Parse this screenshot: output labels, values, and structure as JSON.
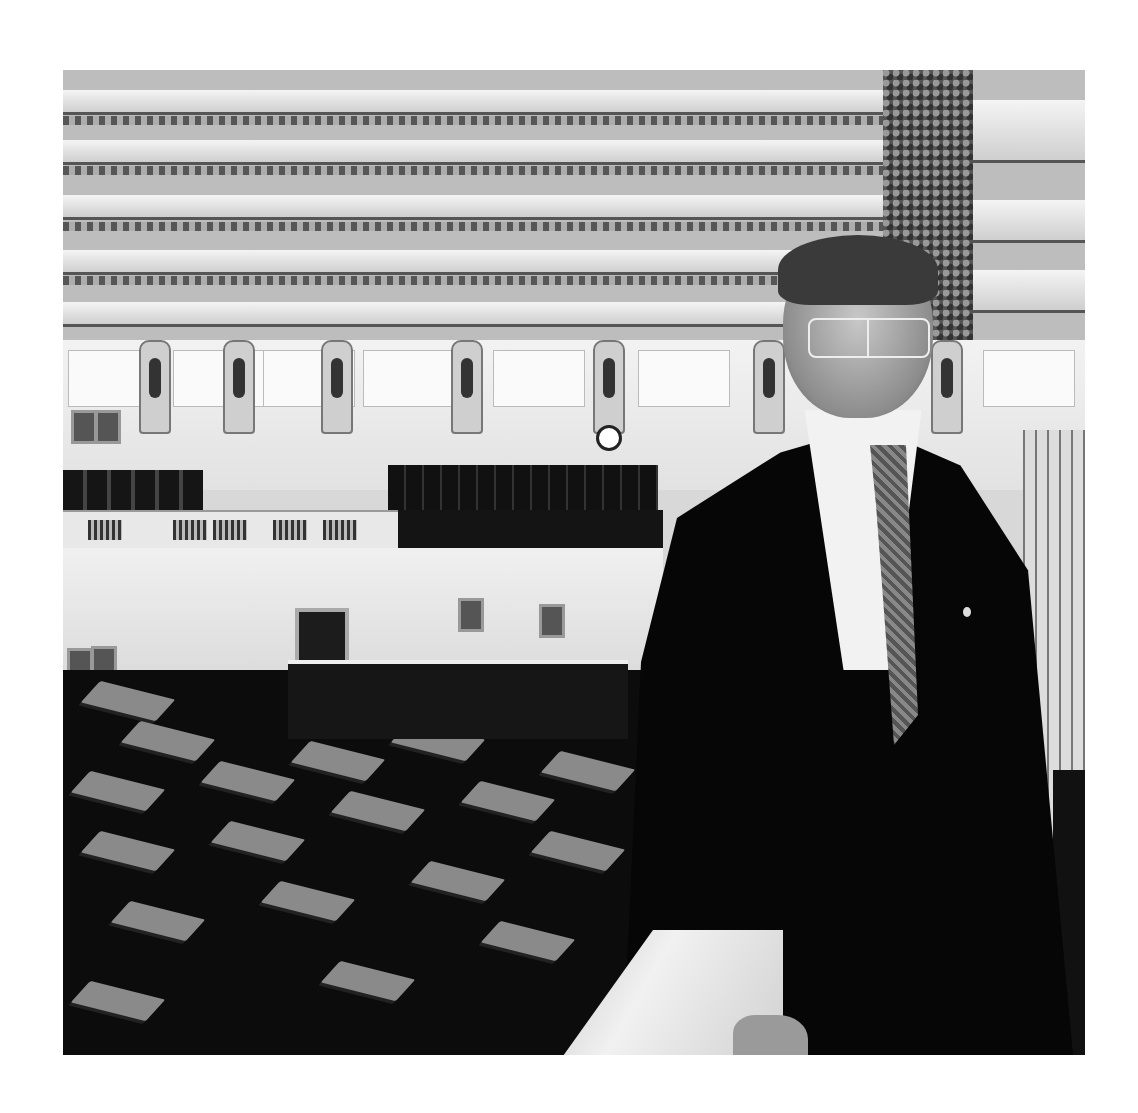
{
  "image": {
    "description": "Black and white photograph of a man in a dark suit, white shirt and patterned tie, wearing glasses, standing at a marble balcony rail in an ornate legislative chamber with coffered ceiling, upper gallery seating, and rows of desks on the floor below.",
    "style": "black-and-white",
    "subject": "man in suit at balcony rail",
    "setting": "legislative chamber",
    "colors": {
      "background": "#ffffff",
      "suit": "#060606",
      "shirt": "#f2f2f2",
      "wall": "#efefef",
      "floor": "#0c0c0c"
    },
    "elements": {
      "ceiling": "coffered ceiling with ornamental friezes",
      "gallery": "upper gallery with dark seating",
      "floor": "rows of desks and chairs",
      "clock": "wall clock",
      "portraits": "framed portraits on walls",
      "rail": "marble balcony rail"
    }
  }
}
